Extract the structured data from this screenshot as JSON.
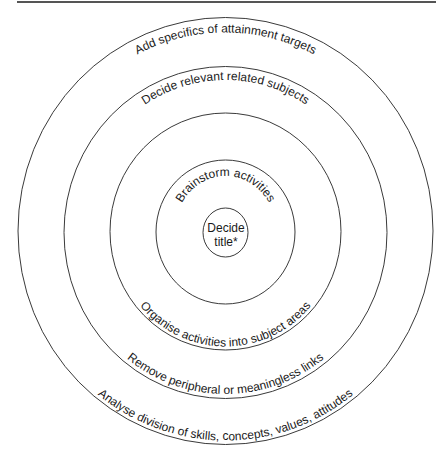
{
  "diagram": {
    "type": "concentric-circles",
    "center_label": {
      "line1": "Decide",
      "line2": "title*"
    },
    "rings": [
      {
        "level": 1,
        "top_label": "Brainstorm activities",
        "bottom_label": ""
      },
      {
        "level": 2,
        "top_label": "",
        "bottom_label": "Organise activities into subject areas"
      },
      {
        "level": 3,
        "top_label": "Decide relevant related subjects",
        "bottom_label": "Remove peripheral or meaningless links"
      },
      {
        "level": 4,
        "top_label": "Add specifics of attainment targets",
        "bottom_label": "Analyse division of skills, concepts, values, attitudes"
      }
    ],
    "colors": {
      "stroke": "#3a3a3a",
      "text": "#1a1a1a",
      "rule": "#555555",
      "background": "#ffffff"
    }
  }
}
